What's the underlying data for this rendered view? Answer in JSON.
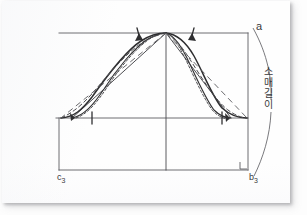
{
  "document": {
    "type": "scanned-page",
    "background_color": "#fdfdfd",
    "paper_color": "#fefefe",
    "ink_color": "#3a3a3c"
  },
  "diagram": {
    "labels": {
      "point_a": "a",
      "point_a_name": "a",
      "point_c3_letter": "c",
      "point_c3_subscript": "3",
      "point_b3_letter": "b",
      "point_b3_subscript": "3",
      "measurement_vertical": "소매길이",
      "measurement_vertical_chars": [
        "소",
        "매",
        "길",
        "이"
      ]
    },
    "colors": {
      "construction_line": "#5e5e62",
      "pattern_curve": "#2e2e30",
      "dashed_curve": "#4a4a4e",
      "measurement_arc": "#6a6a6e"
    },
    "geometry": {
      "frame_left_x": 59,
      "frame_right_x": 248,
      "frame_top_y": 33,
      "frame_mid_y": 118,
      "frame_bottom_y": 170,
      "apex_x": 166,
      "apex_y": 33
    }
  }
}
